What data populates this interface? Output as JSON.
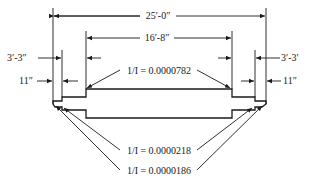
{
  "diagram": {
    "type": "stepped beam elevation with dimensions",
    "dimensions": {
      "overall_length": "25′-0″",
      "center_length": "16′-8″",
      "left_step": "3′-3″",
      "right_step": "3′-3′",
      "left_end": "11″",
      "right_end": "11″"
    },
    "section_labels": {
      "center": "1/I = 0.0000782",
      "middle": "1/I = 0.0000218",
      "end": "1/I = 0.0000186"
    },
    "colors": {
      "line": "#1a1a1a",
      "background": "#ffffff"
    }
  }
}
